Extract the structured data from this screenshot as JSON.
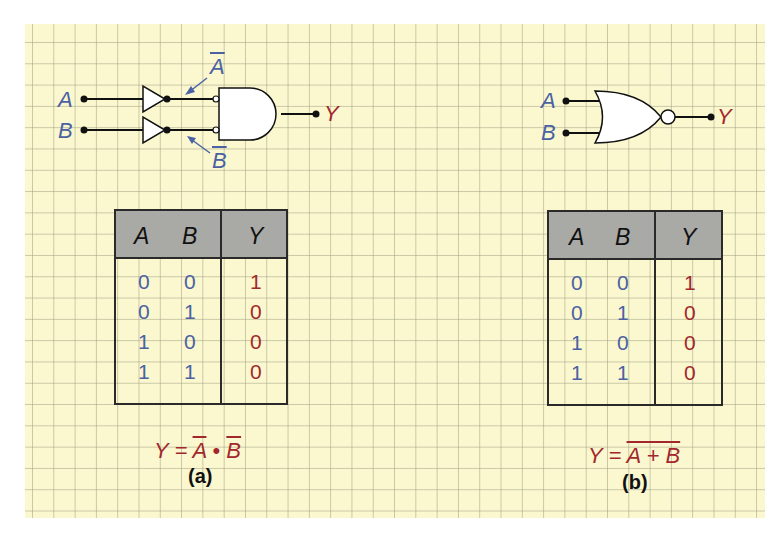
{
  "colors": {
    "input": "#4a62a3",
    "output": "#a3282c",
    "paper": "#fbf8d0",
    "header": "#a9a9a6"
  },
  "panel_a": {
    "circuit": {
      "input_a": "A",
      "input_b": "B",
      "output": "Y",
      "not_a_label": "A",
      "not_b_label": "B",
      "gates": [
        "NOT",
        "NOT",
        "AND (inverted inputs)"
      ]
    },
    "table": {
      "headers": [
        "A",
        "B",
        "Y"
      ],
      "rows": [
        {
          "a": "0",
          "b": "0",
          "y": "1"
        },
        {
          "a": "0",
          "b": "1",
          "y": "0"
        },
        {
          "a": "1",
          "b": "0",
          "y": "0"
        },
        {
          "a": "1",
          "b": "1",
          "y": "0"
        }
      ]
    },
    "expression": {
      "lhs": "Y =",
      "t1": "A",
      "op": "•",
      "t2": "B"
    },
    "caption": "(a)"
  },
  "panel_b": {
    "circuit": {
      "input_a": "A",
      "input_b": "B",
      "output": "Y",
      "gates": [
        "NOR"
      ]
    },
    "table": {
      "headers": [
        "A",
        "B",
        "Y"
      ],
      "rows": [
        {
          "a": "0",
          "b": "0",
          "y": "1"
        },
        {
          "a": "0",
          "b": "1",
          "y": "0"
        },
        {
          "a": "1",
          "b": "0",
          "y": "0"
        },
        {
          "a": "1",
          "b": "1",
          "y": "0"
        }
      ]
    },
    "expression": {
      "lhs": "Y =",
      "rhs": "A + B"
    },
    "caption": "(b)"
  }
}
